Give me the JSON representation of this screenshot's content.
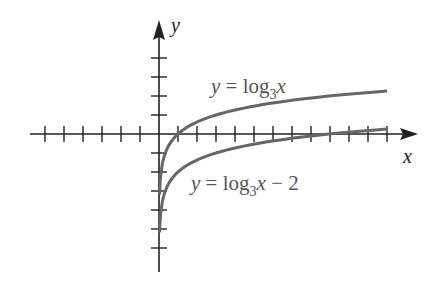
{
  "chart_data": {
    "type": "line",
    "title": "",
    "xlabel": "x",
    "ylabel": "y",
    "axis_ticks": {
      "x_negative": 6,
      "x_positive": 12,
      "y_positive": 4,
      "y_negative": 6
    },
    "series": [
      {
        "name": "y = log_3 x",
        "label": "y = log3x",
        "function": "log3(x)",
        "color": "#666666"
      },
      {
        "name": "y = log_3 x - 2",
        "label": "y = log3x − 2",
        "function": "log3(x) - 2",
        "color": "#666666"
      }
    ],
    "grid": false
  },
  "labels": {
    "xaxis": "x",
    "yaxis": "y",
    "curve1_prefix": "y = log",
    "curve1_base": "3",
    "curve1_suffix": "x",
    "curve2_prefix": "y = log",
    "curve2_base": "3",
    "curve2_suffix": "x − 2"
  }
}
